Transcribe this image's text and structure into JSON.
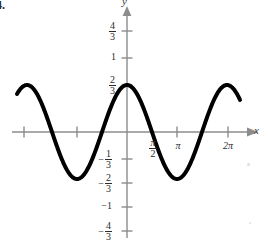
{
  "problem": {
    "number": "4."
  },
  "axes": {
    "x_label": "x",
    "y_label": "y"
  },
  "chart_data": {
    "type": "line",
    "title": "",
    "subtitle": "",
    "xlabel": "x",
    "ylabel": "y",
    "function": "y = (2/3)cos(x)",
    "amplitude": 0.6667,
    "period": "2π",
    "grid": false,
    "legend": null,
    "xlim": [
      -2.2,
      2.55
    ],
    "ylim": [
      -1.3333,
      1.3333
    ],
    "x_unit": "π",
    "x_tick_values": [
      -1.5707963,
      -1.0,
      -0.5,
      0.0,
      0.5,
      1.0,
      1.5707963,
      2.0
    ],
    "x_tick_labels": [
      "",
      "",
      "",
      "",
      "π/2",
      "π",
      "",
      "2π"
    ],
    "x_ticks_shown": [
      {
        "pos_px": 24,
        "label": ""
      },
      {
        "pos_px": 77,
        "label": ""
      },
      {
        "pos_px": 127,
        "label": ""
      },
      {
        "pos_px": 152,
        "label": "π/2"
      },
      {
        "pos_px": 177,
        "label": "π"
      },
      {
        "pos_px": 228,
        "label": "2π"
      }
    ],
    "y_tick_labels_top": [
      "4/3",
      "1",
      "2/3"
    ],
    "y_tick_labels_bottom": [
      "-1/3",
      "-2/3",
      "-1",
      "-4/3"
    ],
    "y_tick_values": [
      1.3333,
      1.0,
      0.6667,
      0.3333,
      0,
      -0.3333,
      -0.6667,
      -1.0,
      -1.3333
    ],
    "key_points": [
      {
        "x": 0.0,
        "y": 0.6667,
        "kind": "maximum"
      },
      {
        "x": 1.0,
        "y": -0.6667,
        "kind": "minimum"
      },
      {
        "x": -1.0,
        "y": -0.6667,
        "kind": "minimum"
      },
      {
        "x": 2.0,
        "y": 0.6667,
        "kind": "maximum"
      },
      {
        "x": -2.0,
        "y": 0.6667,
        "kind": "maximum"
      },
      {
        "x": 0.5,
        "y": 0.0,
        "kind": "x-intercept"
      },
      {
        "x": -0.5,
        "y": 0.0,
        "kind": "x-intercept"
      },
      {
        "x": 1.5,
        "y": 0.0,
        "kind": "x-intercept"
      },
      {
        "x": -1.5,
        "y": 0.0,
        "kind": "x-intercept"
      }
    ],
    "series": [
      {
        "name": "y = (2/3)cos(x)",
        "color": "#000000",
        "line_width": 4,
        "x_start": -2.2,
        "x_end": 2.26,
        "values": []
      }
    ]
  },
  "fraction_labels": {
    "four_thirds": {
      "num": "4",
      "den": "3"
    },
    "one": "1",
    "two_thirds": {
      "num": "2",
      "den": "3"
    },
    "neg_one_third": {
      "sign": "−",
      "num": "1",
      "den": "3"
    },
    "neg_two_thirds": {
      "sign": "−",
      "num": "2",
      "den": "3"
    },
    "neg_one": "−1",
    "neg_four_thirds": {
      "sign": "−",
      "num": "4",
      "den": "3"
    },
    "pi_over_two": {
      "num": "π",
      "den": "2"
    },
    "pi": "π",
    "two_pi": "2π"
  },
  "colors": {
    "curve": "#000000",
    "axis": "#8c8c8c",
    "text": "#2b2b2b",
    "background": "#ffffff"
  }
}
